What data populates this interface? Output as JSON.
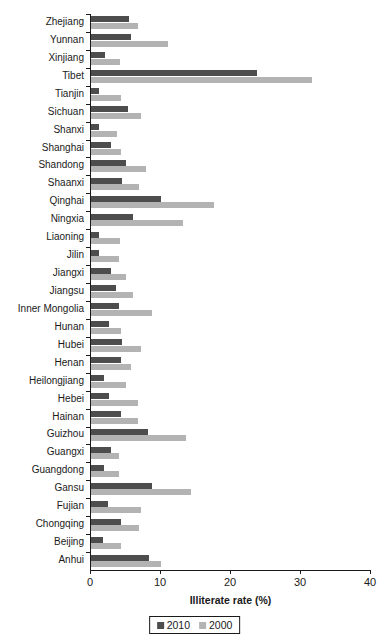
{
  "chart_data": {
    "type": "bar",
    "orientation": "horizontal",
    "title": "",
    "xlabel": "Illiterate rate (%)",
    "ylabel": "",
    "xlim": [
      0,
      40
    ],
    "xticks": [
      0,
      10,
      20,
      30,
      40
    ],
    "grid": false,
    "legend_position": "bottom-center",
    "categories": [
      "Zhejiang",
      "Yunnan",
      "Xinjiang",
      "Tibet",
      "Tianjin",
      "Sichuan",
      "Shanxi",
      "Shanghai",
      "Shandong",
      "Shaanxi",
      "Qinghai",
      "Ningxia",
      "Liaoning",
      "Jilin",
      "Jiangxi",
      "Jiangsu",
      "Inner Mongolia",
      "Hunan",
      "Hubei",
      "Henan",
      "Heilongjiang",
      "Hebei",
      "Hainan",
      "Guizhou",
      "Guangxi",
      "Guangdong",
      "Gansu",
      "Fujian",
      "Chongqing",
      "Beijing",
      "Anhui"
    ],
    "series": [
      {
        "name": "2010",
        "color": "#4d4d4d",
        "values": [
          5.4,
          5.7,
          2.0,
          23.7,
          1.1,
          5.3,
          1.1,
          2.9,
          5.0,
          4.4,
          10.0,
          6.0,
          1.1,
          1.1,
          2.9,
          3.6,
          4.0,
          2.6,
          4.4,
          4.3,
          1.9,
          2.6,
          4.3,
          8.1,
          2.9,
          1.9,
          8.7,
          2.4,
          4.3,
          1.7,
          8.3
        ]
      },
      {
        "name": "2000",
        "color": "#b3b3b3",
        "values": [
          6.7,
          11.0,
          4.1,
          31.6,
          4.3,
          7.1,
          3.7,
          4.3,
          7.9,
          6.9,
          17.6,
          13.1,
          4.1,
          4.0,
          5.0,
          6.0,
          8.7,
          4.3,
          7.1,
          5.7,
          5.0,
          6.7,
          6.7,
          13.6,
          4.0,
          4.0,
          14.3,
          7.1,
          6.9,
          4.3,
          10.0
        ]
      }
    ],
    "legend": [
      {
        "label": "2010",
        "color": "#4d4d4d"
      },
      {
        "label": "2000",
        "color": "#b3b3b3"
      }
    ]
  }
}
